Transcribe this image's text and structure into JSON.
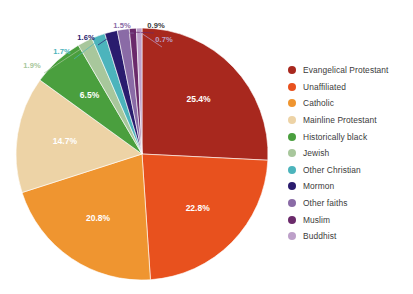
{
  "chart_data": {
    "type": "pie",
    "title": "",
    "subtitle": "",
    "xlabel": "",
    "ylabel": "",
    "unit": "%",
    "start_angle_deg": 0,
    "direction": "clockwise",
    "legend_position": "right",
    "grid": false,
    "categories": [
      "Evangelical Protestant",
      "Unaffiliated",
      "Catholic",
      "Mainline Protestant",
      "Historically black",
      "Jewish",
      "Other Christian",
      "Mormon",
      "Other faiths",
      "Muslim",
      "Buddhist"
    ],
    "values": [
      25.4,
      22.8,
      20.8,
      14.7,
      6.5,
      1.9,
      1.7,
      1.6,
      1.5,
      0.9,
      0.7
    ],
    "data_labels": [
      "25.4%",
      "22.8%",
      "20.8%",
      "14.7%",
      "6.5%",
      "1.9%",
      "1.7%",
      "1.6%",
      "1.5%",
      "0.9%",
      "0.7%"
    ],
    "colors": [
      "#a8281e",
      "#e8511e",
      "#ef9530",
      "#edd3a6",
      "#4a9f3e",
      "#a8c79c",
      "#4cb4bc",
      "#2a1c6e",
      "#8a6ba6",
      "#6b2a6b",
      "#bda0c9"
    ],
    "label_colors": [
      "#ffffff",
      "#ffffff",
      "#ffffff",
      "#ffffff",
      "#ffffff",
      "#a8c79c",
      "#4cb4bc",
      "#2a1c6e",
      "#8a6ba6",
      "#3b3b3b",
      "#bda0c9"
    ],
    "label_placement": [
      "inside",
      "inside",
      "inside",
      "inside",
      "inside",
      "outside",
      "outside",
      "outside",
      "outside",
      "outside",
      "outside"
    ]
  },
  "legend": {
    "items": [
      {
        "label": "Evangelical Protestant",
        "color": "#a8281e"
      },
      {
        "label": "Unaffiliated",
        "color": "#e8511e"
      },
      {
        "label": "Catholic",
        "color": "#ef9530"
      },
      {
        "label": "Mainline Protestant",
        "color": "#edd3a6"
      },
      {
        "label": "Historically black",
        "color": "#4a9f3e"
      },
      {
        "label": "Jewish",
        "color": "#a8c79c"
      },
      {
        "label": "Other Christian",
        "color": "#4cb4bc"
      },
      {
        "label": "Mormon",
        "color": "#2a1c6e"
      },
      {
        "label": "Other faiths",
        "color": "#8a6ba6"
      },
      {
        "label": "Muslim",
        "color": "#6b2a6b"
      },
      {
        "label": "Buddhist",
        "color": "#bda0c9"
      }
    ]
  }
}
